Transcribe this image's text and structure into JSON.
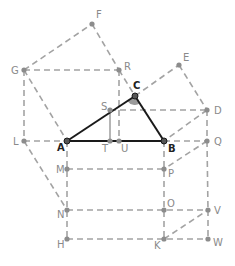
{
  "figure": {
    "colors": {
      "dashed_line": "#a3a3a3",
      "solid_line": "#1a1a1a",
      "point": "#8c8c8c",
      "label": "#8a8a8a",
      "label_triangle": "#222222",
      "angle_fill": "#9a9a9a"
    },
    "points": [
      {
        "id": "F",
        "label": "F",
        "x": 92,
        "y": 24,
        "lx": 96,
        "ly": 18
      },
      {
        "id": "G",
        "label": "G",
        "x": 24,
        "y": 70,
        "lx": 11,
        "ly": 74
      },
      {
        "id": "R",
        "label": "R",
        "x": 119,
        "y": 70,
        "lx": 124,
        "ly": 70
      },
      {
        "id": "E",
        "label": "E",
        "x": 179,
        "y": 65,
        "lx": 183,
        "ly": 61
      },
      {
        "id": "C",
        "label": "C",
        "x": 135,
        "y": 96,
        "lx": 133,
        "ly": 89,
        "dark": true
      },
      {
        "id": "D",
        "label": "D",
        "x": 207,
        "y": 110,
        "lx": 214,
        "ly": 114
      },
      {
        "id": "S",
        "label": "S",
        "x": 110,
        "y": 110,
        "lx": 101,
        "ly": 110
      },
      {
        "id": "L",
        "label": "L",
        "x": 24,
        "y": 141,
        "lx": 13,
        "ly": 145
      },
      {
        "id": "A",
        "label": "A",
        "x": 67,
        "y": 141,
        "lx": 57,
        "ly": 151,
        "dark": true
      },
      {
        "id": "T",
        "label": "T",
        "x": 110,
        "y": 141,
        "lx": 102,
        "ly": 152
      },
      {
        "id": "U",
        "label": "U",
        "x": 119,
        "y": 141,
        "lx": 121,
        "ly": 152
      },
      {
        "id": "B",
        "label": "B",
        "x": 164,
        "y": 141,
        "lx": 168,
        "ly": 152,
        "dark": true
      },
      {
        "id": "Q",
        "label": "Q",
        "x": 207,
        "y": 141,
        "lx": 214,
        "ly": 145
      },
      {
        "id": "M",
        "label": "M",
        "x": 67,
        "y": 169,
        "lx": 56,
        "ly": 173
      },
      {
        "id": "P",
        "label": "P",
        "x": 164,
        "y": 169,
        "lx": 168,
        "ly": 177
      },
      {
        "id": "N",
        "label": "N",
        "x": 67,
        "y": 210,
        "lx": 57,
        "ly": 218
      },
      {
        "id": "O",
        "label": "O",
        "x": 164,
        "y": 210,
        "lx": 167,
        "ly": 207
      },
      {
        "id": "V",
        "label": "V",
        "x": 208,
        "y": 210,
        "lx": 214,
        "ly": 214
      },
      {
        "id": "H",
        "label": "H",
        "x": 67,
        "y": 239,
        "lx": 57,
        "ly": 248
      },
      {
        "id": "K",
        "label": "K",
        "x": 164,
        "y": 239,
        "lx": 154,
        "ly": 249
      },
      {
        "id": "W",
        "label": "W",
        "x": 208,
        "y": 239,
        "lx": 213,
        "ly": 246
      }
    ],
    "solid_segments": [
      [
        "A",
        "C"
      ],
      [
        "C",
        "B"
      ],
      [
        "A",
        "B"
      ]
    ],
    "gray_solid_segments": [
      [
        "S",
        "T"
      ]
    ],
    "dashed_segments": [
      [
        "G",
        "F"
      ],
      [
        "F",
        "R"
      ],
      [
        "G",
        "R"
      ],
      [
        "G",
        "A"
      ],
      [
        "G",
        "L"
      ],
      [
        "L",
        "A"
      ],
      [
        "L",
        "N"
      ],
      [
        "R",
        "C"
      ],
      [
        "R",
        "U"
      ],
      [
        "C",
        "E"
      ],
      [
        "E",
        "D"
      ],
      [
        "D",
        "B"
      ],
      [
        "S",
        "D"
      ],
      [
        "B",
        "Q"
      ],
      [
        "D",
        "Q"
      ],
      [
        "Q",
        "P"
      ],
      [
        "Q",
        "V"
      ],
      [
        "V",
        "W"
      ],
      [
        "A",
        "H"
      ],
      [
        "M",
        "P"
      ],
      [
        "N",
        "V"
      ],
      [
        "H",
        "W"
      ],
      [
        "K",
        "V"
      ],
      [
        "B",
        "K"
      ]
    ],
    "angle_marker": {
      "vertex": "C",
      "description": "filled angle at C"
    }
  }
}
